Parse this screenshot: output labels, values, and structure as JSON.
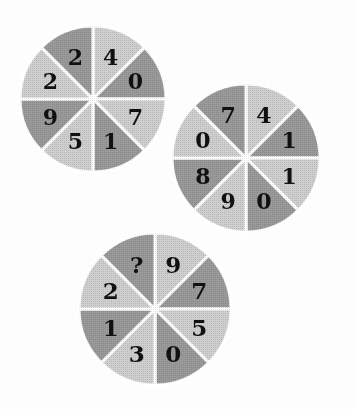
{
  "page": {
    "kind": "puzzle-figure",
    "background_color": "#fdfdfd",
    "width": 355,
    "height": 409
  },
  "palette": {
    "dark_sector": "#9a9a9a",
    "light_sector": "#cfcfcf",
    "divider": "#ffffff",
    "digit_color": "#111111",
    "background": "#fdfdfd"
  },
  "chart_data": {
    "type": "pie",
    "title": "",
    "xlabel": "",
    "ylabel": "",
    "note": "Three eight-sector wheels; every sector holds one digit; one sector holds a question mark.",
    "legend_position": "none",
    "grid": false,
    "wheels": [
      {
        "id": "wheel-1",
        "center_x": 93,
        "center_y": 99,
        "radius": 73,
        "sector_count": 8,
        "sector_angle_deg": 45,
        "start_angle_deg": -90,
        "categories": [
          "s1",
          "s2",
          "s3",
          "s4",
          "s5",
          "s6",
          "s7",
          "s8"
        ],
        "values": [
          45,
          45,
          45,
          45,
          45,
          45,
          45,
          45
        ],
        "sectors": [
          {
            "label": "4",
            "shade": "light"
          },
          {
            "label": "0",
            "shade": "dark"
          },
          {
            "label": "7",
            "shade": "light"
          },
          {
            "label": "1",
            "shade": "dark"
          },
          {
            "label": "5",
            "shade": "light"
          },
          {
            "label": "9",
            "shade": "dark"
          },
          {
            "label": "2",
            "shade": "light"
          },
          {
            "label": "2",
            "shade": "dark"
          }
        ]
      },
      {
        "id": "wheel-2",
        "center_x": 246,
        "center_y": 158,
        "radius": 74,
        "sector_count": 8,
        "sector_angle_deg": 45,
        "start_angle_deg": -90,
        "categories": [
          "s1",
          "s2",
          "s3",
          "s4",
          "s5",
          "s6",
          "s7",
          "s8"
        ],
        "values": [
          45,
          45,
          45,
          45,
          45,
          45,
          45,
          45
        ],
        "sectors": [
          {
            "label": "4",
            "shade": "light"
          },
          {
            "label": "1",
            "shade": "dark"
          },
          {
            "label": "1",
            "shade": "light"
          },
          {
            "label": "0",
            "shade": "dark"
          },
          {
            "label": "9",
            "shade": "light"
          },
          {
            "label": "8",
            "shade": "dark"
          },
          {
            "label": "0",
            "shade": "light"
          },
          {
            "label": "7",
            "shade": "dark"
          }
        ]
      },
      {
        "id": "wheel-3",
        "center_x": 155,
        "center_y": 309,
        "radius": 76,
        "sector_count": 8,
        "sector_angle_deg": 45,
        "start_angle_deg": -90,
        "categories": [
          "s1",
          "s2",
          "s3",
          "s4",
          "s5",
          "s6",
          "s7",
          "s8"
        ],
        "values": [
          45,
          45,
          45,
          45,
          45,
          45,
          45,
          45
        ],
        "sectors": [
          {
            "label": "9",
            "shade": "light"
          },
          {
            "label": "7",
            "shade": "dark"
          },
          {
            "label": "5",
            "shade": "light"
          },
          {
            "label": "0",
            "shade": "dark"
          },
          {
            "label": "3",
            "shade": "light"
          },
          {
            "label": "1",
            "shade": "dark"
          },
          {
            "label": "2",
            "shade": "light"
          },
          {
            "label": "?",
            "shade": "dark"
          }
        ]
      }
    ]
  }
}
